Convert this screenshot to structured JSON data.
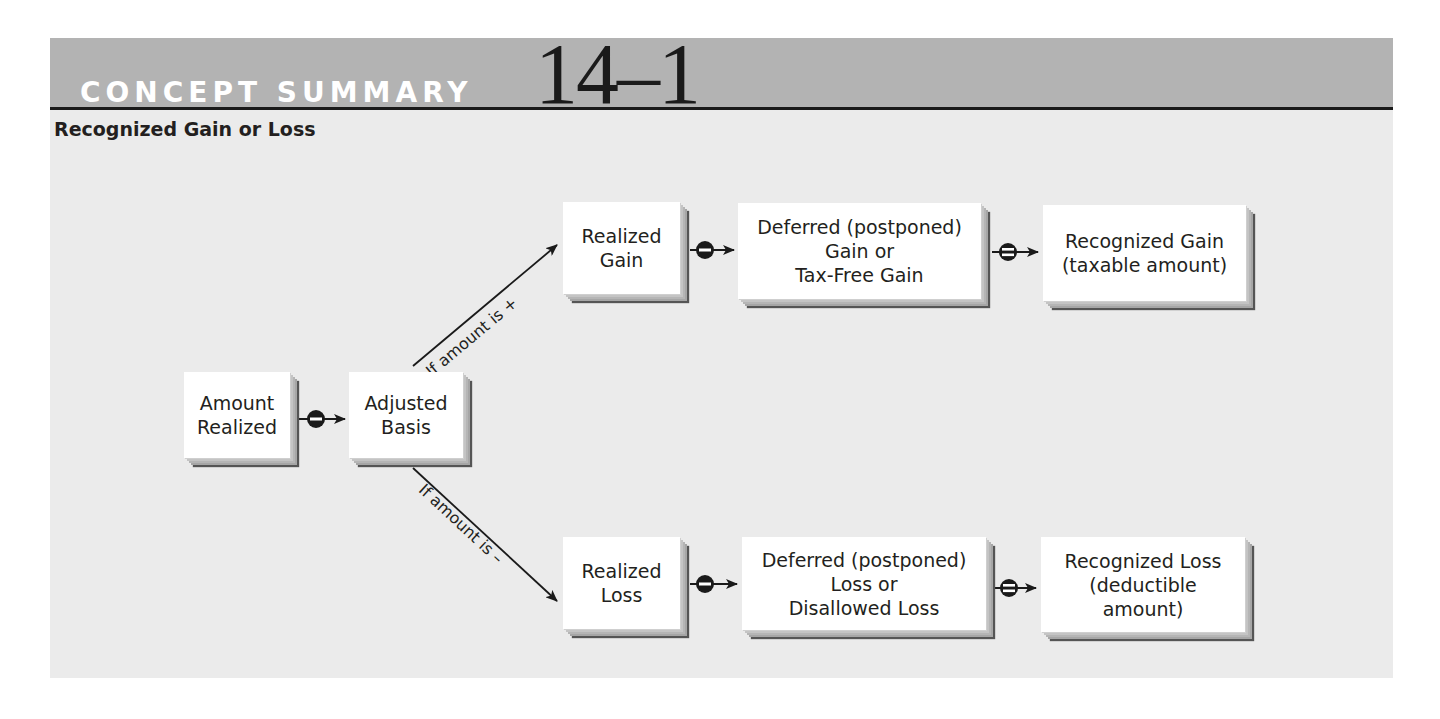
{
  "header": {
    "label": "CONCEPT SUMMARY",
    "number": "14–1"
  },
  "subtitle": "Recognized Gain or Loss",
  "nodes": {
    "amount_realized": "Amount\nRealized",
    "adjusted_basis": "Adjusted\nBasis",
    "realized_gain": "Realized\nGain",
    "deferred_gain": "Deferred (postponed)\nGain or\nTax-Free Gain",
    "recognized_gain": "Recognized Gain\n(taxable amount)",
    "realized_loss": "Realized\nLoss",
    "deferred_loss": "Deferred (postponed)\nLoss or\nDisallowed Loss",
    "recognized_loss": "Recognized Loss\n(deductible\namount)"
  },
  "conditions": {
    "positive": "If amount is +",
    "negative": "If amount is –"
  },
  "operators": {
    "minus": "minus-operator",
    "equals": "equals-operator"
  },
  "colors": {
    "header_band": "#b3b3b3",
    "panel_bg": "#ebebeb",
    "box_fill": "#ffffff",
    "ink": "#231f20"
  }
}
